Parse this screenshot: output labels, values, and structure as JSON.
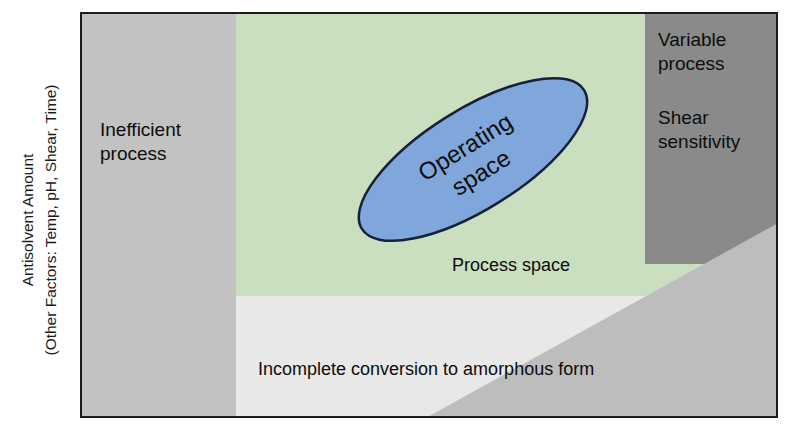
{
  "axes": {
    "y_label_line1": "Antisolvent Amount",
    "y_label_line2": "(Other Factors: Temp, pH, Shear, Time)"
  },
  "regions": {
    "inefficient": {
      "label": "Inefficient\nprocess",
      "color": "#c2c2c2"
    },
    "process_space": {
      "label": "Process space",
      "color": "#c9dfc0"
    },
    "variable_process": {
      "label": "Variable\nprocess",
      "color": "#8a8a8a"
    },
    "shear_sensitivity": {
      "label": "Shear\nsensitivity"
    },
    "incomplete_conversion": {
      "label": "Incomplete conversion to amorphous form",
      "color": "#e8e8e8"
    },
    "diagonal_wedge": {
      "color": "#bdbdbd"
    }
  },
  "operating_space": {
    "label_line1": "Operating",
    "label_line2": "space",
    "fill": "#7fa7db",
    "stroke": "#15213a",
    "rotation_deg": -32
  },
  "frame": {
    "border_color": "#1c1c1c",
    "background": "#ececed"
  }
}
